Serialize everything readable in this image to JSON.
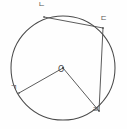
{
  "figure": {
    "kind": "circle-geometry-diagram",
    "background_color": "#fefefe",
    "stroke_color": "#4a4a4a",
    "label_color": "#555555",
    "width": 127,
    "height": 129,
    "circle": {
      "name": "main-circle",
      "center_label": "O",
      "cx": 63,
      "cy": 68,
      "r": 52
    },
    "points": [
      {
        "id": "n",
        "label": "ㄴ",
        "x": 44,
        "y": 17,
        "label_x": 38,
        "label_y": 1,
        "position": "top-left"
      },
      {
        "id": "d",
        "label": "ㄷ",
        "x": 103,
        "y": 28,
        "label_x": 100,
        "label_y": 15,
        "position": "top-right"
      },
      {
        "id": "g",
        "label": "ㄱ",
        "x": 19,
        "y": 93,
        "label_x": 10,
        "label_y": 84,
        "position": "bottom-left"
      },
      {
        "id": "r",
        "label": "ㄹ",
        "x": 99,
        "y": 111,
        "label_x": 92,
        "label_y": 106,
        "position": "bottom-right"
      }
    ],
    "segments": [
      {
        "id": "seg-o-g",
        "name": "radius-o-to-g",
        "from": "O",
        "to": "ㄱ",
        "type": "radius",
        "x1": 63,
        "y1": 68,
        "x2": 19,
        "y2": 93
      },
      {
        "id": "seg-o-r",
        "name": "radius-o-to-r",
        "from": "O",
        "to": "ㄹ",
        "type": "radius",
        "x1": 63,
        "y1": 68,
        "x2": 99,
        "y2": 111
      },
      {
        "id": "seg-n-d",
        "name": "chord-n-to-d",
        "from": "ㄴ",
        "to": "ㄷ",
        "type": "chord",
        "x1": 44,
        "y1": 17,
        "x2": 103,
        "y2": 28
      },
      {
        "id": "seg-d-r",
        "name": "chord-d-to-r",
        "from": "ㄷ",
        "to": "ㄹ",
        "type": "chord",
        "x1": 103,
        "y1": 28,
        "x2": 99,
        "y2": 111
      }
    ]
  }
}
